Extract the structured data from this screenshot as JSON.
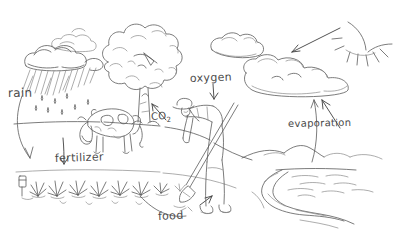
{
  "illustration": {
    "title": "Agricultural water and nutrient cycle sketch",
    "style": "hand-drawn pencil line drawing",
    "background_color": "#ffffff",
    "ink_color": "#4a4a4a",
    "canvas": {
      "width": 394,
      "height": 242
    }
  },
  "labels": {
    "rain": "rain",
    "fertilizer": "fertilizer",
    "food": "food",
    "co2_text": "CO",
    "co2_subscript": "2",
    "oxygen": "oxygen",
    "evaporation": "evaporation"
  },
  "elements": [
    {
      "name": "rain-cloud",
      "description": "dark cloud at upper left with falling rain streaks and drops"
    },
    {
      "name": "small-cloud",
      "description": "small wispy cloud above the rain cloud"
    },
    {
      "name": "tree",
      "description": "large bushy tree with scalloped crown and trunk, center left"
    },
    {
      "name": "cow",
      "description": "spotted cow grazing in the field below the tree"
    },
    {
      "name": "crop-row",
      "description": "row of leafy crop plants across the lower left field"
    },
    {
      "name": "fence-post",
      "description": "small marker post at the left end of the crop row"
    },
    {
      "name": "farmer",
      "description": "person bent over working the soil with a hoe, wearing a hat and boots"
    },
    {
      "name": "sun",
      "description": "sun arc with radiating rays in the top right corner"
    },
    {
      "name": "sky-cloud",
      "description": "long layered cloud bank at right receiving evaporated water"
    },
    {
      "name": "hills",
      "description": "distant hills and mountains on the right horizon"
    },
    {
      "name": "lake",
      "description": "body of water with ripple lines at right"
    },
    {
      "name": "river",
      "description": "winding river flowing from the lake toward the foreground"
    },
    {
      "name": "ground-line",
      "description": "horizon and field boundary lines across the scene"
    }
  ],
  "arrows": [
    {
      "name": "rain-arrow",
      "from": "rain-cloud",
      "to": "crop-row",
      "label": "rain",
      "direction": "curved down-left"
    },
    {
      "name": "fertilizer-arrow",
      "from": "cow",
      "to": "crop-row",
      "label": "fertilizer",
      "direction": "down"
    },
    {
      "name": "food-arrow",
      "from": "crop-row",
      "to": "farmer",
      "label": "food",
      "direction": "curved up-right"
    },
    {
      "name": "co2-arrow",
      "from": "farmer",
      "to": "tree",
      "label": "CO2",
      "direction": "up-left"
    },
    {
      "name": "oxygen-arrow",
      "from": "tree",
      "to": "farmer",
      "label": "oxygen",
      "direction": "down"
    },
    {
      "name": "evaporation-arrow",
      "from": "lake",
      "to": "sky-cloud",
      "label": "evaporation",
      "direction": "curved up"
    },
    {
      "name": "sunlight-arrow",
      "from": "sun",
      "to": "sky-cloud",
      "label": "",
      "direction": "down-left"
    },
    {
      "name": "cloud-feed-arrow",
      "from": "river",
      "to": "sky-cloud",
      "label": "",
      "direction": "up-left"
    }
  ]
}
